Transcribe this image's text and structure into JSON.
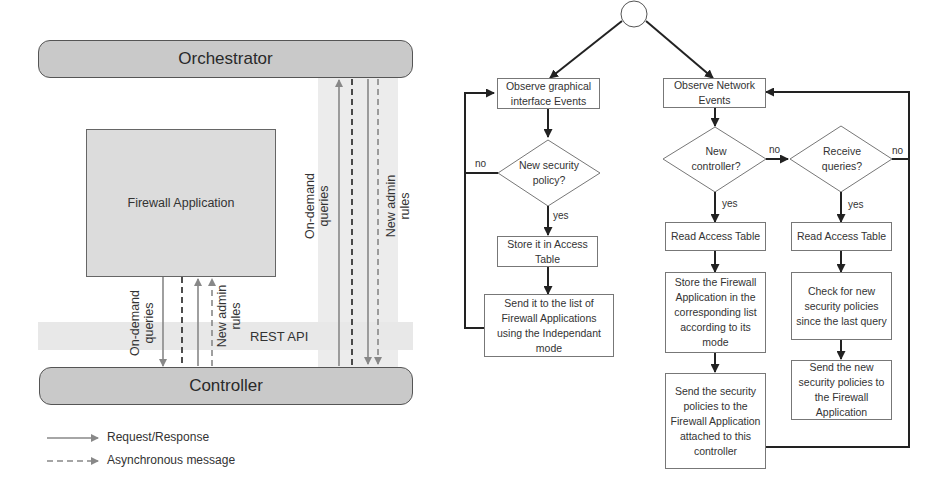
{
  "architecture": {
    "orchestrator_label": "Orchestrator",
    "controller_label": "Controller",
    "firewall_app_label": "Firewall Application",
    "rest_api_label": "REST API",
    "left_arrows": {
      "queries_label_line1": "On-demand",
      "queries_label_line2": "queries",
      "rules_label_line1": "New admin",
      "rules_label_line2": "rules"
    },
    "right_arrows": {
      "queries_label_line1": "On-demand",
      "queries_label_line2": "queries",
      "rules_label_line1": "New admin",
      "rules_label_line2": "rules"
    },
    "legend": [
      {
        "style": "solid",
        "label": "Request/Response"
      },
      {
        "style": "dashed",
        "label": "Asynchronous message"
      }
    ],
    "colors": {
      "bar_fill": "#c9c9c9",
      "box_fill": "#dcdcdc",
      "band_fill": "#ececec",
      "arrow_gray": "#777777",
      "arrow_black": "#222222"
    }
  },
  "flowchart": {
    "start_node": "",
    "left_branch": {
      "observe": "Observe graphical interface Events",
      "decision": "New security policy?",
      "yes_label": "yes",
      "no_label": "no",
      "store": "Store it in Access Table",
      "send": "Send it to the list of Firewall Applications using the Independant mode"
    },
    "right_branch": {
      "observe": "Observe Network Events",
      "decision_controller": "New controller?",
      "decision_controller_yes": "yes",
      "decision_controller_no": "no",
      "decision_queries": "Receive queries?",
      "decision_queries_yes": "yes",
      "decision_queries_no": "no",
      "controller_path": {
        "read": "Read Access Table",
        "store": "Store the Firewall Application in the corresponding list according to its mode",
        "send": "Send the security policies to the Firewall Application attached to this controller"
      },
      "queries_path": {
        "read": "Read Access Table",
        "check": "Check for new security policies since the last query",
        "send": "Send the new security policies to the Firewall Application"
      }
    }
  }
}
